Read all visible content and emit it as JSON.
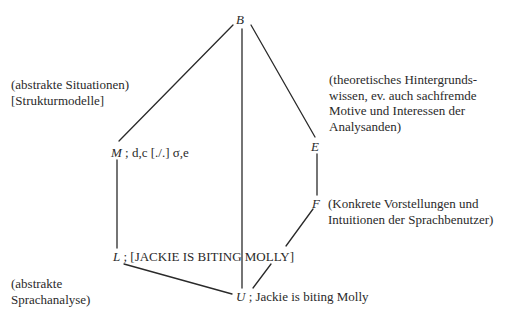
{
  "diagram": {
    "nodes": {
      "B": {
        "symbol": "B",
        "label": ""
      },
      "M": {
        "symbol": "M",
        "label": " ; d,c [./.] σ,e"
      },
      "E": {
        "symbol": "E",
        "label": ""
      },
      "F": {
        "symbol": "F",
        "label": ""
      },
      "L": {
        "symbol": "L",
        "label": " ; [JACKIE IS BITING MOLLY]"
      },
      "U": {
        "symbol": "U",
        "label": " ; Jackie is biting Molly"
      }
    },
    "edges": [
      {
        "from": "B",
        "to": "M"
      },
      {
        "from": "B",
        "to": "U"
      },
      {
        "from": "B",
        "to": "E"
      },
      {
        "from": "M",
        "to": "L"
      },
      {
        "from": "E",
        "to": "F"
      },
      {
        "from": "F",
        "to": "U"
      },
      {
        "from": "L",
        "to": "U"
      }
    ],
    "annotations": {
      "situations": {
        "lines": [
          "(abstrakte Situationen)",
          "[Strukturmodelle]"
        ]
      },
      "background": {
        "lines": [
          "(theoretisches Hintergrunds-",
          "wissen, ev. auch sachfremde",
          "Motive und Interessen der",
          "Analysanden)"
        ]
      },
      "concrete": {
        "lines": [
          "(Konkrete Vorstellungen und",
          "Intuitionen der Sprachbenutzer)"
        ]
      },
      "language_analysis": {
        "lines": [
          "(abstrakte",
          "Sprachanalyse)"
        ]
      }
    }
  }
}
